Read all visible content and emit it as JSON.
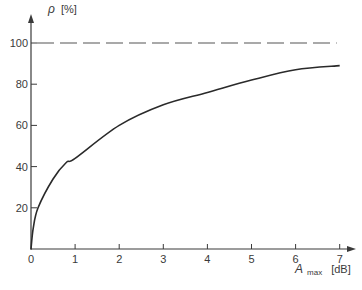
{
  "chart_data": {
    "type": "line",
    "title": "",
    "xlabel": "A_max [dB]",
    "ylabel": "ρ [%]",
    "xlabel_parts": {
      "symbol": "A",
      "subscript": "max",
      "unit": "[dB]"
    },
    "ylabel_parts": {
      "symbol": "ρ",
      "unit": "[%]"
    },
    "xlim": [
      0,
      7
    ],
    "ylim": [
      0,
      100
    ],
    "x_ticks": [
      0,
      1,
      2,
      3,
      4,
      5,
      6,
      7
    ],
    "y_ticks": [
      20,
      40,
      60,
      80,
      100
    ],
    "grid": false,
    "legend": null,
    "series": [
      {
        "name": "ρ(A_max)",
        "style": "solid",
        "x": [
          0,
          0.05,
          0.16,
          0.5,
          0.8,
          1,
          2,
          3,
          4,
          5,
          6,
          7
        ],
        "y": [
          0,
          10,
          20,
          34,
          42,
          44,
          60,
          70,
          76,
          82,
          87,
          89
        ]
      },
      {
        "name": "asymptote",
        "style": "dashed",
        "x": [
          0,
          7
        ],
        "y": [
          100,
          100
        ]
      }
    ],
    "colors": {
      "line": "#2a2a2a",
      "axis": "#3a3a3a",
      "dashed": "#555555"
    }
  }
}
